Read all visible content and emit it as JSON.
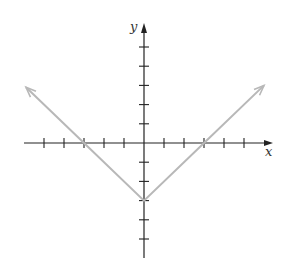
{
  "chart_data": {
    "type": "line",
    "title": "",
    "xlabel": "x",
    "ylabel": "y",
    "function": "y = |x| - 3",
    "xlim": [
      -5,
      5
    ],
    "ylim": [
      -5,
      5
    ],
    "grid": false,
    "x_ticks": [
      -5,
      -4,
      -3,
      -2,
      -1,
      1,
      2,
      3,
      4,
      5
    ],
    "y_ticks": [
      -5,
      -4,
      -3,
      -2,
      -1,
      1,
      2,
      3,
      4,
      5
    ],
    "tick_labels_shown": false,
    "series": [
      {
        "name": "graph",
        "color": "#b8b8b8",
        "points": [
          [
            -5.9,
            2.9
          ],
          [
            -3,
            0
          ],
          [
            0,
            -3
          ],
          [
            3,
            0
          ],
          [
            6.0,
            3.0
          ]
        ],
        "arrows_at_ends": true
      }
    ],
    "key_points": {
      "vertex": [
        0,
        -3
      ],
      "x_intercepts": [
        -3,
        3
      ],
      "y_intercept": -3
    }
  },
  "colors": {
    "axis": "#222222",
    "curve": "#b8b8b8",
    "background": "#ffffff"
  }
}
